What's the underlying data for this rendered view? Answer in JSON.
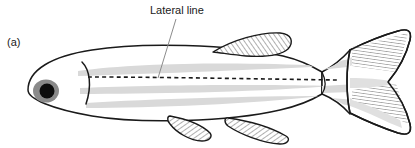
{
  "figure": {
    "panel_label": "(a)",
    "background_color": "#ffffff",
    "width": 415,
    "height": 148
  },
  "annotations": {
    "lateral_line": {
      "label": "Lateral line",
      "label_x": 150,
      "label_y": 14,
      "leader_from_x": 176,
      "leader_from_y": 19,
      "leader_to_x": 158,
      "leader_to_y": 76,
      "leader_color": "#8c8c8c"
    }
  },
  "organism": {
    "common_name": "fish",
    "view": "lateral",
    "facing": "left"
  },
  "colors": {
    "outline": "#1a1a1a",
    "body_fill": "#ffffff",
    "stripe": "#d9d9d9",
    "fin_fill": "#ffffff",
    "hatch": "#4d4d4d",
    "eye_iris": "#8a8a8a",
    "eye_pupil": "#0d0d0d",
    "lateral_line": "#1a1a1a",
    "leader": "#8c8c8c"
  },
  "parts": [
    {
      "name": "body",
      "label": "body"
    },
    {
      "name": "eye",
      "label": "eye"
    },
    {
      "name": "operculum",
      "label": "operculum"
    },
    {
      "name": "dorsal-fin",
      "label": "dorsal fin"
    },
    {
      "name": "pelvic-fin",
      "label": "pelvic fin"
    },
    {
      "name": "anal-fin",
      "label": "anal fin"
    },
    {
      "name": "caudal-fin",
      "label": "caudal fin"
    },
    {
      "name": "caudal-peduncle",
      "label": "caudal peduncle"
    },
    {
      "name": "lateral-line",
      "label": "lateral line"
    },
    {
      "name": "body-stripe",
      "label": "body stripe"
    }
  ]
}
